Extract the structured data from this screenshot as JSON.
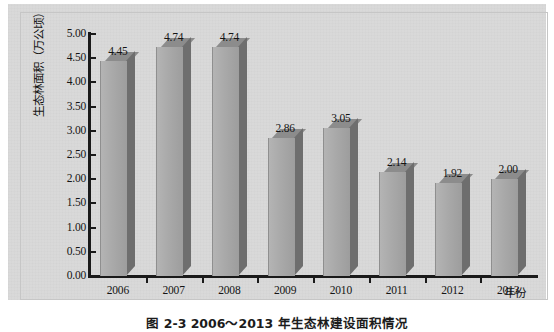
{
  "chart_data": {
    "type": "bar",
    "title": "",
    "categories": [
      "2006",
      "2007",
      "2008",
      "2009",
      "2010",
      "2011",
      "2012",
      "2013"
    ],
    "values": [
      4.45,
      4.74,
      4.74,
      2.86,
      3.05,
      2.14,
      1.92,
      2.0
    ],
    "data_labels": [
      "4.45",
      "4.74",
      "4.74",
      "2.86",
      "3.05",
      "2.14",
      "1.92",
      "2.00"
    ],
    "xlabel": "年份",
    "ylabel": "生态林面积（万公顷）",
    "ylim": [
      0.0,
      5.0
    ],
    "ytick_labels": [
      "5.00",
      "4.50",
      "4.00",
      "3.50",
      "3.00",
      "2.50",
      "2.00",
      "1.50",
      "1.00",
      "0.50",
      "0.00"
    ],
    "ytick_values": [
      5.0,
      4.5,
      4.0,
      3.5,
      3.0,
      2.5,
      2.0,
      1.5,
      1.0,
      0.5,
      0.0
    ],
    "grid": false,
    "legend": null,
    "legend_position": "none",
    "style": "3d-column",
    "bar_front_color": "#a9a9a9",
    "bar_side_color": "#6e6e6e",
    "bar_top_color": "#8c8c8c",
    "axis_color": "#1a1a1a",
    "plot_background": "#d9d9d9"
  },
  "figure": {
    "caption": "图 2-3  2006～2013 年生态林建设面积情况"
  }
}
